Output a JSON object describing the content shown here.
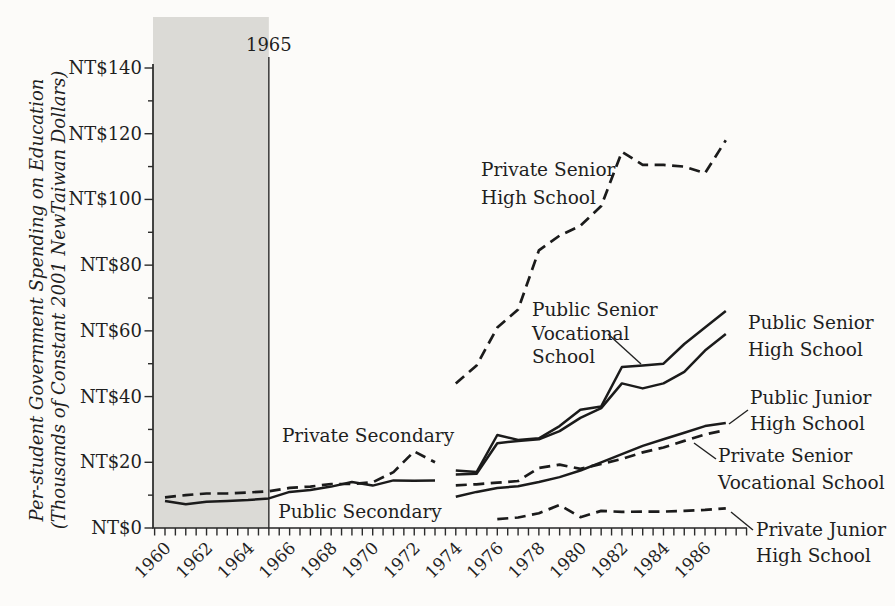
{
  "figure": {
    "background": "#fcfbf9",
    "ink": "#1f1f1f",
    "shaded_region": {
      "label": "1965",
      "from_year": 1960,
      "to_year": 1965,
      "fill": "#dbdad6"
    },
    "y_axis": {
      "title_line1": "Per-student Government Spending on Education",
      "title_line2": "(Thousands of Constant 2001 NewTaiwan Dollars)",
      "tick_labels": [
        "NT$0",
        "NT$20",
        "NT$40",
        "NT$60",
        "NT$80",
        "NT$100",
        "NT$120",
        "NT$140"
      ],
      "major_step": 20,
      "minor_step": 10,
      "min": 0,
      "max": 140
    },
    "x_axis": {
      "tick_labels": [
        "1960",
        "1962",
        "1964",
        "1966",
        "1968",
        "1970",
        "1972",
        "1974",
        "1976",
        "1978",
        "1980",
        "1982",
        "1984",
        "1986"
      ],
      "minor_tick_step_years": 0.5,
      "first_year": 1960,
      "last_tick_year": 1988
    }
  },
  "chart_data": {
    "type": "line",
    "title": "",
    "xlabel": "",
    "ylabel": "Per-student Government Spending on Education (Thousands of Constant 2001 NewTaiwan Dollars)",
    "xlim": [
      1960,
      1988
    ],
    "ylim": [
      0,
      140
    ],
    "grid": false,
    "legend": "inline-annotations",
    "series": [
      {
        "id": "private-secondary",
        "name": "Private Secondary",
        "line": "dashed",
        "x": [
          1960,
          1961,
          1962,
          1963,
          1964,
          1965,
          1966,
          1967,
          1968,
          1969,
          1970,
          1971,
          1972,
          1973
        ],
        "values": [
          9.3,
          10.0,
          10.5,
          10.5,
          10.8,
          11.2,
          12.2,
          12.6,
          13.4,
          13.4,
          13.9,
          17.0,
          23.3,
          20.0
        ]
      },
      {
        "id": "public-secondary",
        "name": "Public Secondary",
        "line": "solid",
        "x": [
          1960,
          1961,
          1962,
          1963,
          1964,
          1965,
          1966,
          1967,
          1968,
          1969,
          1970,
          1971,
          1972,
          1973
        ],
        "values": [
          8.2,
          7.2,
          8.0,
          8.2,
          8.5,
          9.0,
          11.0,
          11.6,
          12.6,
          14.0,
          12.9,
          14.5,
          14.4,
          14.5
        ]
      },
      {
        "id": "private-senior-high",
        "name": "Private Senior High School",
        "line": "dashed",
        "x": [
          1974,
          1975,
          1976,
          1977,
          1978,
          1979,
          1980,
          1981,
          1982,
          1983,
          1984,
          1985,
          1986,
          1987
        ],
        "values": [
          44,
          49.5,
          61,
          66.5,
          84.5,
          89,
          92,
          98,
          114.5,
          110.5,
          110.5,
          110,
          108,
          118
        ]
      },
      {
        "id": "public-senior-vocational",
        "name": "Public Senior Vocational School",
        "line": "solid",
        "x": [
          1974,
          1975,
          1976,
          1977,
          1978,
          1979,
          1980,
          1981,
          1982,
          1983,
          1984,
          1985,
          1986,
          1987
        ],
        "values": [
          17.5,
          17,
          28.3,
          26.8,
          27.3,
          31,
          36,
          37,
          49,
          49.5,
          50,
          56,
          61,
          66
        ]
      },
      {
        "id": "public-senior-high",
        "name": "Public Senior High School",
        "line": "solid",
        "x": [
          1974,
          1975,
          1976,
          1977,
          1978,
          1979,
          1980,
          1981,
          1982,
          1983,
          1984,
          1985,
          1986,
          1987
        ],
        "values": [
          16.3,
          16.5,
          25.8,
          26.5,
          27,
          29.5,
          33.5,
          36.5,
          44,
          42.5,
          44,
          47.5,
          54,
          59
        ]
      },
      {
        "id": "public-junior-high",
        "name": "Public Junior High School",
        "line": "solid",
        "x": [
          1974,
          1975,
          1976,
          1977,
          1978,
          1979,
          1980,
          1981,
          1982,
          1983,
          1984,
          1985,
          1986,
          1987
        ],
        "values": [
          9.5,
          11,
          12.2,
          12.7,
          14,
          15.5,
          17.5,
          20,
          22.5,
          25,
          27,
          29,
          31,
          32
        ]
      },
      {
        "id": "private-senior-vocational",
        "name": "Private Senior Vocational School",
        "line": "dashed",
        "x": [
          1974,
          1975,
          1976,
          1977,
          1978,
          1979,
          1980,
          1981,
          1982,
          1983,
          1984,
          1985,
          1986,
          1987
        ],
        "values": [
          13,
          13.3,
          13.8,
          14.3,
          18.3,
          19.3,
          18,
          19.5,
          21,
          23,
          24.5,
          26.5,
          28.5,
          29.8
        ]
      },
      {
        "id": "private-junior-high",
        "name": "Private Junior High School",
        "line": "dashed",
        "x": [
          1976,
          1977,
          1978,
          1979,
          1980,
          1981,
          1982,
          1983,
          1984,
          1985,
          1986,
          1987
        ],
        "values": [
          2.7,
          3.2,
          4.5,
          7,
          3.3,
          5.2,
          4.9,
          5,
          5,
          5.2,
          5.5,
          6
        ]
      }
    ],
    "annotations": [
      {
        "id": "private-secondary-label",
        "lines": [
          "Private Secondary"
        ],
        "x": 368,
        "line_y": [
          442
        ],
        "anchor": "middle",
        "leader": null
      },
      {
        "id": "public-secondary-label",
        "lines": [
          "Public Secondary"
        ],
        "x": 360,
        "line_y": [
          518
        ],
        "anchor": "middle",
        "leader": null
      },
      {
        "id": "private-senior-high-label",
        "lines": [
          "Private Senior",
          "High School"
        ],
        "x": 481,
        "line_y": [
          176,
          204
        ],
        "anchor": "start",
        "leader": null
      },
      {
        "id": "public-senior-vocational-label",
        "lines": [
          "Public Senior",
          "Vocational",
          "School"
        ],
        "x": 532,
        "line_y": [
          316,
          340,
          363
        ],
        "anchor": "start",
        "leader": [
          608,
          334,
          641,
          364
        ]
      },
      {
        "id": "public-senior-high-label",
        "lines": [
          "Public Senior",
          "High School"
        ],
        "x": 748,
        "line_y": [
          329,
          356
        ],
        "anchor": "start",
        "leader": null
      },
      {
        "id": "public-junior-high-label",
        "lines": [
          "Public Junior",
          "High School"
        ],
        "x": 750,
        "line_y": [
          404,
          430
        ],
        "anchor": "start",
        "leader": [
          729,
          424,
          748,
          410
        ]
      },
      {
        "id": "private-senior-vocational-label",
        "lines": [
          "Private Senior",
          "Vocational School"
        ],
        "x": 718,
        "line_y": [
          462,
          489
        ],
        "anchor": "start",
        "leader": [
          694,
          443,
          716,
          459
        ]
      },
      {
        "id": "private-junior-high-label",
        "lines": [
          "Private Junior",
          "High School"
        ],
        "x": 756,
        "line_y": [
          536,
          562
        ],
        "anchor": "start",
        "leader": [
          731,
          512,
          753,
          530
        ]
      }
    ]
  }
}
